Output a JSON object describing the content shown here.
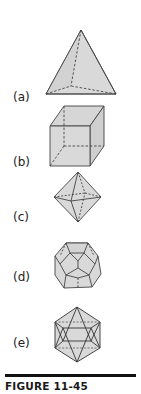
{
  "figure": {
    "caption": "FIGURE 11-45",
    "fill_color": "#d9d9d9",
    "edge_color": "#444444",
    "panels": [
      {
        "label": "(a)",
        "solid": "tetrahedron"
      },
      {
        "label": "(b)",
        "solid": "cube"
      },
      {
        "label": "(c)",
        "solid": "octahedron"
      },
      {
        "label": "(d)",
        "solid": "dodecahedron"
      },
      {
        "label": "(e)",
        "solid": "icosahedron"
      }
    ]
  }
}
